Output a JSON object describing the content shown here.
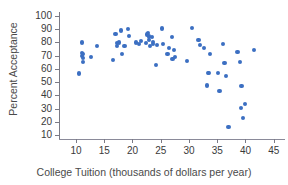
{
  "chart_data": {
    "type": "scatter",
    "title": "",
    "xlabel": "College Tuition (thousands of dollars per year)",
    "ylabel": "Percent Acceptance",
    "xlim": [
      7,
      47
    ],
    "ylim": [
      7,
      103
    ],
    "xticks": [
      10,
      15,
      20,
      25,
      30,
      35,
      40,
      45
    ],
    "yticks": [
      10,
      20,
      30,
      40,
      50,
      60,
      70,
      80,
      90,
      100
    ],
    "grid": false,
    "legend": null,
    "marker_color": "#3c6fc2",
    "axis_color": "#7a7a85",
    "points": [
      {
        "x": 10.6,
        "y": 56.5
      },
      {
        "x": 11.0,
        "y": 80.0
      },
      {
        "x": 11.1,
        "y": 72.0
      },
      {
        "x": 11.1,
        "y": 69.5
      },
      {
        "x": 11.2,
        "y": 68.0
      },
      {
        "x": 11.2,
        "y": 65.5
      },
      {
        "x": 11.3,
        "y": 71.0
      },
      {
        "x": 12.6,
        "y": 69.0
      },
      {
        "x": 13.7,
        "y": 77.5
      },
      {
        "x": 16.6,
        "y": 67.0
      },
      {
        "x": 17.0,
        "y": 86.5
      },
      {
        "x": 17.2,
        "y": 79.5
      },
      {
        "x": 17.3,
        "y": 77.5
      },
      {
        "x": 17.6,
        "y": 80.0
      },
      {
        "x": 18.0,
        "y": 89.0
      },
      {
        "x": 18.2,
        "y": 71.5
      },
      {
        "x": 18.6,
        "y": 77.0
      },
      {
        "x": 19.2,
        "y": 90.0
      },
      {
        "x": 19.4,
        "y": 85.0
      },
      {
        "x": 20.6,
        "y": 80.0
      },
      {
        "x": 21.1,
        "y": 79.0
      },
      {
        "x": 21.5,
        "y": 81.0
      },
      {
        "x": 22.4,
        "y": 79.5
      },
      {
        "x": 22.6,
        "y": 86.0
      },
      {
        "x": 22.8,
        "y": 87.0
      },
      {
        "x": 22.9,
        "y": 84.5
      },
      {
        "x": 23.0,
        "y": 82.0
      },
      {
        "x": 23.1,
        "y": 77.0
      },
      {
        "x": 23.4,
        "y": 84.0
      },
      {
        "x": 23.6,
        "y": 80.5
      },
      {
        "x": 23.7,
        "y": 79.0
      },
      {
        "x": 24.1,
        "y": 63.0
      },
      {
        "x": 24.3,
        "y": 78.0
      },
      {
        "x": 25.2,
        "y": 90.5
      },
      {
        "x": 25.4,
        "y": 79.0
      },
      {
        "x": 26.2,
        "y": 71.5
      },
      {
        "x": 26.4,
        "y": 76.0
      },
      {
        "x": 27.0,
        "y": 84.0
      },
      {
        "x": 27.1,
        "y": 67.5
      },
      {
        "x": 27.3,
        "y": 74.5
      },
      {
        "x": 27.6,
        "y": 69.0
      },
      {
        "x": 29.6,
        "y": 66.0
      },
      {
        "x": 30.5,
        "y": 91.0
      },
      {
        "x": 31.7,
        "y": 82.0
      },
      {
        "x": 32.0,
        "y": 78.0
      },
      {
        "x": 32.6,
        "y": 76.0
      },
      {
        "x": 33.2,
        "y": 47.5
      },
      {
        "x": 33.4,
        "y": 57.0
      },
      {
        "x": 33.6,
        "y": 57.0
      },
      {
        "x": 33.7,
        "y": 71.5
      },
      {
        "x": 35.1,
        "y": 57.0
      },
      {
        "x": 35.4,
        "y": 43.5
      },
      {
        "x": 36.0,
        "y": 79.0
      },
      {
        "x": 36.3,
        "y": 64.5
      },
      {
        "x": 36.5,
        "y": 54.5
      },
      {
        "x": 37.0,
        "y": 16.0
      },
      {
        "x": 38.6,
        "y": 72.5
      },
      {
        "x": 39.0,
        "y": 65.5
      },
      {
        "x": 39.2,
        "y": 30.5
      },
      {
        "x": 39.3,
        "y": 47.0
      },
      {
        "x": 39.6,
        "y": 23.0
      },
      {
        "x": 39.9,
        "y": 33.5
      },
      {
        "x": 41.5,
        "y": 74.0
      }
    ]
  }
}
